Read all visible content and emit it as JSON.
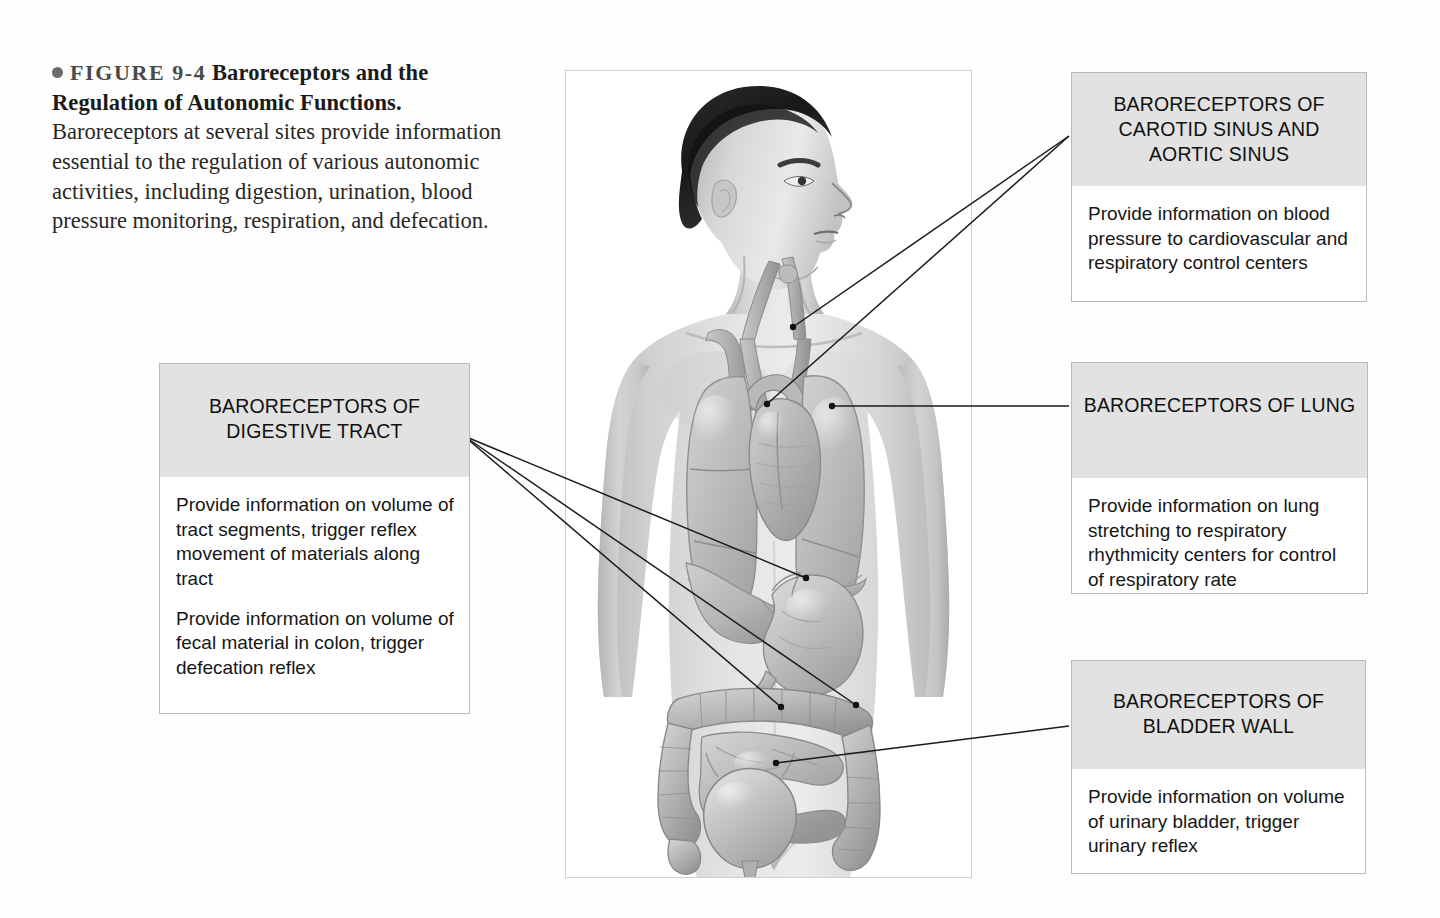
{
  "figure": {
    "number": "FIGURE 9-4",
    "title": "Baroreceptors and the Regulation of Autonomic Functions.",
    "body": "Baroreceptors at several sites provide information essential to the regulation of various autonomic activities, including digestion, urination, blood pressure monitoring, respiration, and defecation."
  },
  "labels": {
    "carotid": {
      "heading": "BARORECEPTORS OF CAROTID SINUS AND AORTIC SINUS",
      "body": "Provide information on blood pressure to cardiovascular and respiratory control centers"
    },
    "lung": {
      "heading": "BARORECEPTORS OF LUNG",
      "body": "Provide information on lung stretching to respiratory rhythmicity centers for control of respiratory rate"
    },
    "bladder": {
      "heading": "BARORECEPTORS OF BLADDER WALL",
      "body": "Provide information on volume of urinary bladder, trigger urinary reflex"
    },
    "digestive": {
      "heading": "BARORECEPTORS OF DIGESTIVE TRACT",
      "body1": "Provide information on volume of tract segments, trigger reflex movement of materials along tract",
      "body2": "Provide information on volume of fecal material in colon, trigger defecation reflex"
    }
  },
  "illustration": {
    "alt": "Grayscale anatomical illustration of a male torso showing carotid arteries, aortic arch, heart, lungs, liver, stomach, small and large intestines, and urinary bladder",
    "organs": [
      "carotid-artery",
      "aortic-arch",
      "heart",
      "left-lung",
      "right-lung",
      "liver",
      "stomach",
      "large-intestine",
      "small-intestine",
      "urinary-bladder"
    ]
  },
  "colors": {
    "header_fill": "#e2e2e2",
    "box_border": "#b9b9b9",
    "leader_line": "#1a1a1a",
    "page_background": "#fefefe",
    "caption_text": "#262422"
  }
}
